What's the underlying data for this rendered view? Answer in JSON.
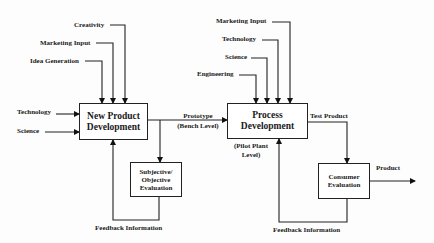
{
  "diagram": {
    "type": "flowchart",
    "nodes": {
      "npd": {
        "label_line1": "New Product",
        "label_line2": "Development"
      },
      "subjective": {
        "label_line1": "Subjective/",
        "label_line2": "Objective",
        "label_line3": "Evaluation"
      },
      "process": {
        "label_line1": "Process",
        "label_line2": "Development",
        "sublabel_line1": "(Pilot Plant",
        "sublabel_line2": "Level)"
      },
      "consumer": {
        "label_line1": "Consumer",
        "label_line2": "Evaluation"
      }
    },
    "npd_inputs": {
      "creativity": "Creativity",
      "marketing": "Marketing Input",
      "idea": "Idea Generation",
      "technology": "Technology",
      "science": "Science"
    },
    "process_inputs": {
      "marketing": "Marketing Input",
      "technology": "Technology",
      "science": "Science",
      "engineering": "Engineering"
    },
    "edges": {
      "prototype_line1": "Prototype",
      "prototype_line2": "(Bench Level)",
      "test_product": "Test Product",
      "product": "Product",
      "feedback_left": "Feedback Information",
      "feedback_right": "Feedback Information"
    }
  }
}
